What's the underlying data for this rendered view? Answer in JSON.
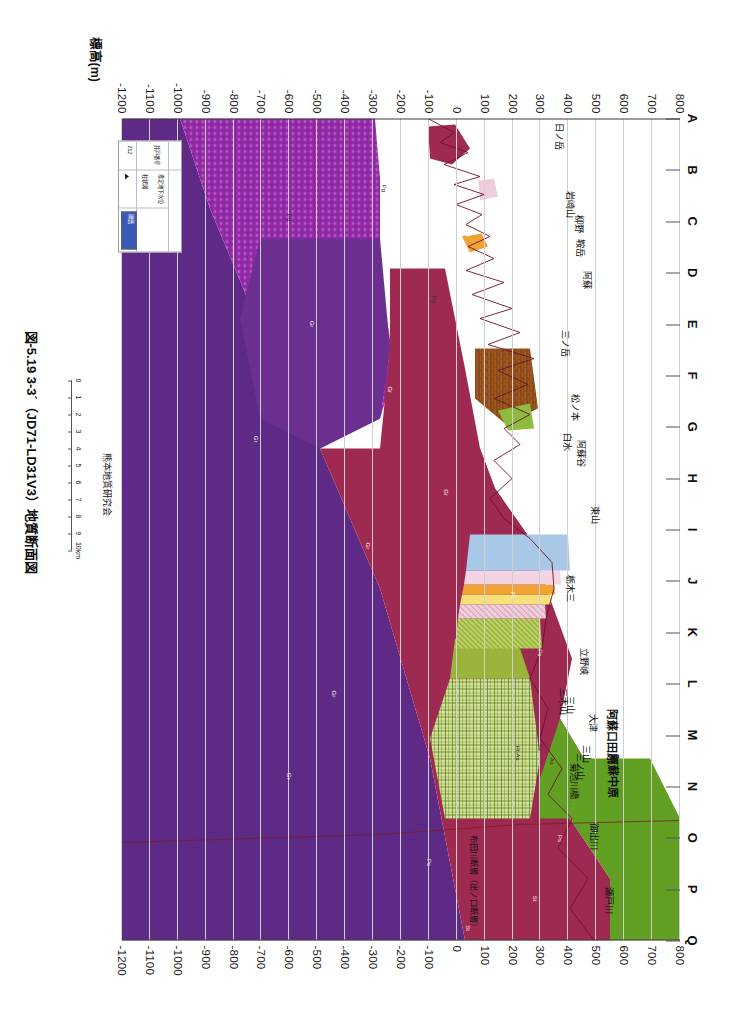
{
  "figure": {
    "caption": "図-5.19  3-3´（JD71-LD31V3）地質断面図",
    "credit": "熊本地質研究会",
    "y_axis_title": "標高(m)"
  },
  "axes": {
    "elevation_ticks": [
      800,
      700,
      600,
      500,
      400,
      300,
      200,
      100,
      0,
      -100,
      -200,
      -300,
      -400,
      -500,
      -600,
      -700,
      -800,
      -900,
      -1000,
      -1100,
      -1200
    ],
    "station_labels": [
      "A",
      "B",
      "C",
      "D",
      "E",
      "F",
      "G",
      "H",
      "I",
      "J",
      "K",
      "L",
      "M",
      "N",
      "O",
      "P",
      "Q"
    ],
    "elev_max": 800,
    "elev_min": -1200
  },
  "distance_scale": {
    "ticks": [
      "0",
      "1",
      "2",
      "3",
      "4",
      "5",
      "6",
      "7",
      "8",
      "9",
      "10km"
    ],
    "unit": "km"
  },
  "place_labels": [
    {
      "text": "日ノ岳",
      "x": 0.022,
      "y": 0.215
    },
    {
      "text": "岩崎山",
      "x": 0.105,
      "y": 0.195
    },
    {
      "text": "柳野",
      "x": 0.128,
      "y": 0.18
    },
    {
      "text": "鞍岳",
      "x": 0.158,
      "y": 0.178
    },
    {
      "text": "阿蘇",
      "x": 0.196,
      "y": 0.165
    },
    {
      "text": "三ノ岳",
      "x": 0.274,
      "y": 0.205
    },
    {
      "text": "松ノ本",
      "x": 0.352,
      "y": 0.186
    },
    {
      "text": "白水",
      "x": 0.393,
      "y": 0.2
    },
    {
      "text": "阿蘇谷",
      "x": 0.408,
      "y": 0.176
    },
    {
      "text": "東山",
      "x": 0.482,
      "y": 0.15
    },
    {
      "text": "栃木三",
      "x": 0.572,
      "y": 0.196
    },
    {
      "text": "立野峡",
      "x": 0.66,
      "y": 0.17
    },
    {
      "text": "三木山",
      "x": 0.709,
      "y": 0.208
    },
    {
      "text": "三山",
      "x": 0.714,
      "y": 0.196
    },
    {
      "text": "大津",
      "x": 0.735,
      "y": 0.154
    },
    {
      "text": "三山",
      "x": 0.773,
      "y": 0.166
    },
    {
      "text": "三ノ山",
      "x": 0.788,
      "y": 0.178
    },
    {
      "text": "菊池川橋",
      "x": 0.806,
      "y": 0.188
    },
    {
      "text": "御出川",
      "x": 0.873,
      "y": 0.152
    },
    {
      "text": "瀬戸川",
      "x": 0.951,
      "y": 0.126
    }
  ],
  "big_place_labels": [
    {
      "text": "阿蘇口田原",
      "x": 0.752,
      "y": 0.12
    },
    {
      "text": "阿蘇中原",
      "x": 0.8,
      "y": 0.118
    }
  ],
  "fault_labels": [
    {
      "text": "布田川断層（出ノ口断層）",
      "x": 0.93,
      "y": 0.368
    }
  ],
  "unit_labels": [
    {
      "text": "Pg",
      "x": 0.085,
      "y": 0.53,
      "light": false
    },
    {
      "text": "Pg",
      "x": 0.12,
      "y": 0.7,
      "light": false
    },
    {
      "text": "Pg",
      "x": 0.22,
      "y": 0.44,
      "light": false
    },
    {
      "text": "Gr",
      "x": 0.25,
      "y": 0.66,
      "light": true
    },
    {
      "text": "Gr",
      "x": 0.33,
      "y": 0.52,
      "light": true
    },
    {
      "text": "Gr",
      "x": 0.39,
      "y": 0.76,
      "light": true
    },
    {
      "text": "Gr",
      "x": 0.455,
      "y": 0.42,
      "light": true
    },
    {
      "text": "Gr",
      "x": 0.52,
      "y": 0.56,
      "light": true
    },
    {
      "text": "Ps",
      "x": 0.58,
      "y": 0.3,
      "light": true
    },
    {
      "text": "Ps",
      "x": 0.65,
      "y": 0.25,
      "light": true
    },
    {
      "text": "Gr",
      "x": 0.7,
      "y": 0.62,
      "light": true
    },
    {
      "text": "Gr",
      "x": 0.8,
      "y": 0.7,
      "light": true
    },
    {
      "text": "Ps",
      "x": 0.876,
      "y": 0.215,
      "light": true
    },
    {
      "text": "Ps",
      "x": 0.905,
      "y": 0.45,
      "light": true
    },
    {
      "text": "St",
      "x": 0.949,
      "y": 0.26,
      "light": true
    },
    {
      "text": "St",
      "x": 0.985,
      "y": 0.38,
      "light": true
    },
    {
      "text": "As",
      "x": 0.782,
      "y": 0.23,
      "light": false
    },
    {
      "text": "Ss",
      "x": 0.765,
      "y": 0.25,
      "light": false
    },
    {
      "text": "Ht-As",
      "x": 0.772,
      "y": 0.29,
      "light": false
    }
  ],
  "legend": {
    "title": "凡例",
    "rows": [
      {
        "label": "井戸番号",
        "value": ""
      },
      {
        "label": "推定地下水位",
        "value": ""
      },
      {
        "label": "柱状図",
        "value": ""
      }
    ],
    "well_no": "212",
    "swatch_label": "礫層",
    "swatch_color": "#3a5bb5"
  },
  "colors": {
    "volcanic_maroon": "#9e2a52",
    "granite_purple": "#6b2f8f",
    "green_andesite": "#62a024",
    "olive_green": "#9ab33a",
    "alluvium_blue": "#a9c8e8",
    "sand_yellow": "#f5e07a",
    "pink_tuff": "#e8b7cf",
    "orange_pumice": "#f0a233",
    "pale_pink": "#f2d4e2",
    "grid_gray": "#cfcfcf"
  }
}
